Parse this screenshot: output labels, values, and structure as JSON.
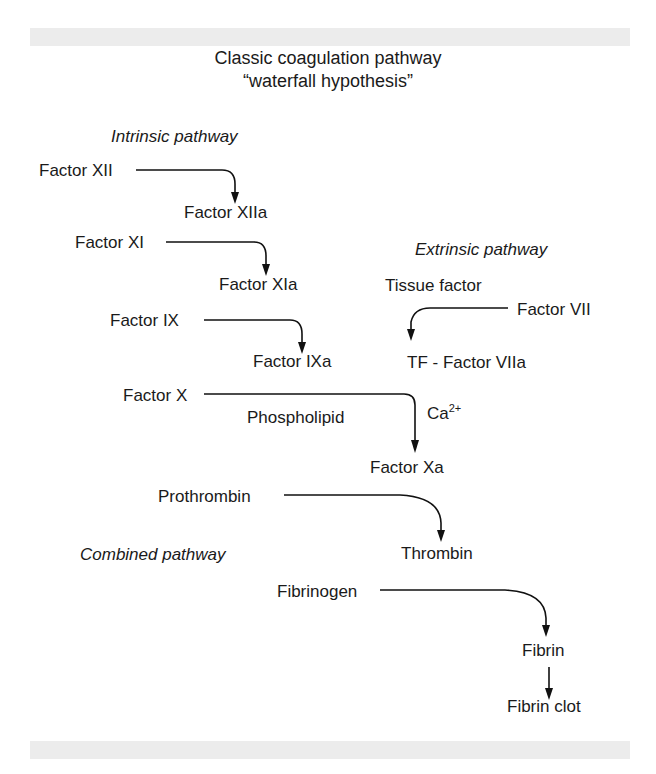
{
  "diagram": {
    "title_line1": "Classic coagulation pathway",
    "title_line2": "“waterfall hypothesis”",
    "sections": {
      "intrinsic": "Intrinsic pathway",
      "extrinsic": "Extrinsic pathway",
      "combined": "Combined pathway"
    },
    "nodes": {
      "factor_xii": "Factor XII",
      "factor_xiia": "Factor XIIa",
      "factor_xi": "Factor XI",
      "factor_xia": "Factor XIa",
      "factor_ix": "Factor IX",
      "factor_ixa": "Factor IXa",
      "tissue_factor": "Tissue factor",
      "factor_vii": "Factor VII",
      "tf_factor_viia": "TF - Factor VIIa",
      "factor_x": "Factor X",
      "phospholipid": "Phospholipid",
      "calcium_base": "Ca",
      "calcium_sup": "2+",
      "factor_xa": "Factor Xa",
      "prothrombin": "Prothrombin",
      "thrombin": "Thrombin",
      "fibrinogen": "Fibrinogen",
      "fibrin": "Fibrin",
      "fibrin_clot": "Fibrin clot"
    },
    "edges": [
      {
        "from": "Factor XII",
        "to": "Factor XIIa"
      },
      {
        "from": "Factor XI",
        "to": "Factor XIa"
      },
      {
        "from": "Factor IX",
        "to": "Factor IXa"
      },
      {
        "from": "Factor VII",
        "to": "TF - Factor VIIa"
      },
      {
        "from": "Factor X",
        "to": "Factor Xa",
        "cofactors": [
          "Phospholipid",
          "Ca2+"
        ]
      },
      {
        "from": "Prothrombin",
        "to": "Thrombin"
      },
      {
        "from": "Fibrinogen",
        "to": "Fibrin"
      },
      {
        "from": "Fibrin",
        "to": "Fibrin clot"
      }
    ]
  }
}
